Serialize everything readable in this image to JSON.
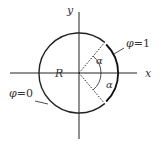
{
  "diagram": {
    "type": "circle-boundary-conditions",
    "axes": {
      "x_label": "x",
      "y_label": "y"
    },
    "radius_label": "R",
    "angle_label_upper": "α",
    "angle_label_lower": "α",
    "boundary_right": {
      "label": "φ = 1",
      "symbol": "φ",
      "eq": "=1"
    },
    "boundary_left": {
      "label": "φ = 0",
      "symbol": "φ",
      "eq": "=0"
    },
    "colors": {
      "stroke": "#222222",
      "text": "#333333",
      "background": "#ffffff"
    }
  }
}
